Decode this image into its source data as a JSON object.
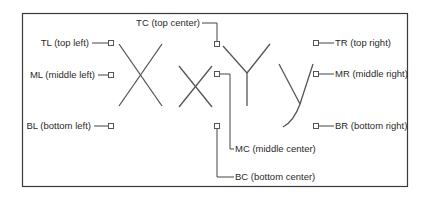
{
  "diagram": {
    "glyphs": [
      "X",
      "x",
      "Y",
      "y"
    ],
    "colors": {
      "stroke": "#555555",
      "frame": "#3a3a3a",
      "text": "#2a2a2a",
      "marker_fill": "#ffffff"
    },
    "anchors": [
      {
        "id": "TL",
        "label": "TL (top left)"
      },
      {
        "id": "ML",
        "label": "ML (middle left)"
      },
      {
        "id": "BL",
        "label": "BL (bottom left)"
      },
      {
        "id": "TC",
        "label": "TC (top center)"
      },
      {
        "id": "MC",
        "label": "MC (middle center)"
      },
      {
        "id": "BC",
        "label": "BC (bottom center)"
      },
      {
        "id": "TR",
        "label": "TR (top right)"
      },
      {
        "id": "MR",
        "label": "MR (middle right)"
      },
      {
        "id": "BR",
        "label": "BR (bottom right)"
      }
    ]
  }
}
